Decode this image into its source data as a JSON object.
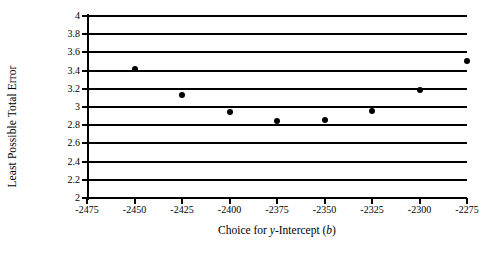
{
  "chart_data": {
    "type": "scatter",
    "title": "",
    "xlabel": "Choice for y-Intercept (b)",
    "xlabel_parts": [
      {
        "text": "Choice for ",
        "italic": false
      },
      {
        "text": "y",
        "italic": true
      },
      {
        "text": "-Intercept (",
        "italic": false
      },
      {
        "text": "b",
        "italic": true
      },
      {
        "text": ")",
        "italic": false
      }
    ],
    "ylabel": "Least Possible Total Error",
    "x": [
      -2450,
      -2425,
      -2400,
      -2375,
      -2350,
      -2325,
      -2300,
      -2275
    ],
    "values": [
      3.42,
      3.13,
      2.94,
      2.85,
      2.86,
      2.96,
      3.19,
      3.51
    ],
    "series": [
      {
        "name": "Least Possible Total Error",
        "x": [
          -2450,
          -2425,
          -2400,
          -2375,
          -2350,
          -2325,
          -2300,
          -2275
        ],
        "values": [
          3.42,
          3.13,
          2.94,
          2.85,
          2.86,
          2.96,
          3.19,
          3.51
        ]
      }
    ],
    "xlim": [
      -2475,
      -2275
    ],
    "ylim": [
      2,
      4
    ],
    "xticks": [
      -2475,
      -2450,
      -2425,
      -2400,
      -2375,
      -2350,
      -2325,
      -2300,
      -2275
    ],
    "xticklabels": [
      "-2475",
      "-2450",
      "-2425",
      "-2400",
      "-2375",
      "-2350",
      "-2325",
      "-2300",
      "-2275"
    ],
    "yticks": [
      2,
      2.2,
      2.4,
      2.6,
      2.8,
      3,
      3.2,
      3.4,
      3.6,
      3.8,
      4
    ],
    "yticklabels": [
      "2",
      "2.2",
      "2.4",
      "2.6",
      "2.8",
      "3",
      "3.2",
      "3.4",
      "3.6",
      "3.8",
      "4"
    ],
    "grid": "horizontal",
    "legend": "none",
    "marker": "filled-circle",
    "marker_color": "#000000",
    "axis_color": "#000000",
    "background_color": "#ffffff"
  }
}
